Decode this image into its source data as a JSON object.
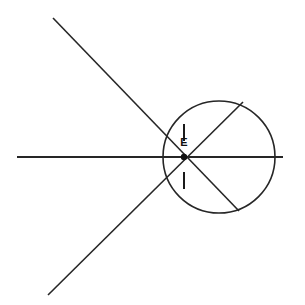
{
  "figure": {
    "kind": "geometry-diagram",
    "canvas": {
      "width": 305,
      "height": 305,
      "background": "#ffffff"
    },
    "stroke_color": "#262626",
    "label_color": "#111111"
  },
  "labels": {
    "vertex_e": "E"
  },
  "points": {
    "E": {
      "x": 184,
      "y": 157
    }
  },
  "circle": {
    "name": "main-circle",
    "cx": 219,
    "cy": 157,
    "r": 56,
    "stroke_width": 1.6
  },
  "lines": {
    "horizontal": {
      "name": "horizontal-line",
      "x1": 17,
      "y1": 157,
      "x2": 283,
      "y2": 157,
      "stroke_width": 1.8
    },
    "secant_upper_left_to_lower_right": {
      "name": "secant-descending",
      "x1": 53,
      "y1": 18,
      "x2": 239,
      "y2": 211,
      "stroke_width": 1.6
    },
    "secant_lower_left_to_upper_right": {
      "name": "secant-ascending",
      "x1": 48,
      "y1": 295,
      "x2": 243,
      "y2": 102,
      "stroke_width": 1.6
    }
  },
  "tick_marks": {
    "upper": {
      "name": "angle-tick-upper",
      "x1": 184,
      "y1": 124,
      "x2": 184,
      "y2": 141,
      "stroke_width": 2.0
    },
    "lower": {
      "name": "angle-tick-lower",
      "x1": 184,
      "y1": 172,
      "x2": 184,
      "y2": 189,
      "stroke_width": 2.0
    }
  },
  "vertex_marker": {
    "name": "vertex-dot-e",
    "cx": 184,
    "cy": 157,
    "r": 3.2
  },
  "label_positions": {
    "vertex_e": {
      "x": 184,
      "y": 143
    }
  }
}
